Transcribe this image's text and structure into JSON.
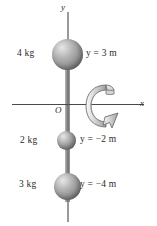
{
  "figure": {
    "axes": {
      "y_label": "y",
      "x_label": "x",
      "origin_label": "O"
    },
    "masses": [
      {
        "mass_label": "4 kg",
        "position_label": "y = 3 m",
        "value_kg": 4,
        "y_m": 3
      },
      {
        "mass_label": "2 kg",
        "position_label": "y = −2 m",
        "value_kg": 2,
        "y_m": -2
      },
      {
        "mass_label": "3 kg",
        "position_label": "y = −4 m",
        "value_kg": 3,
        "y_m": -4
      }
    ],
    "rotation_arrow": "curved-rotation-arrow-about-y-axis",
    "colors": {
      "background": "#ffffff",
      "sphere_light": "#e8e8e8",
      "sphere_dark": "#6a6a6a",
      "rod": "#8e8e8e",
      "axis_line": "#4a4a4a",
      "text": "#2b2b2b"
    }
  }
}
